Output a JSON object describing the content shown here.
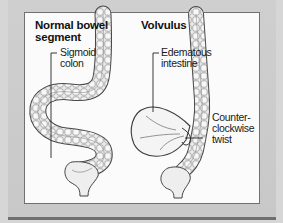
{
  "figure": {
    "panels": [
      {
        "title_line1": "Normal bowel",
        "title_line2": "segment",
        "labels": [
          {
            "line1": "Sigmoid",
            "line2": "colon"
          }
        ]
      },
      {
        "title_line1": "Volvulus",
        "labels": [
          {
            "line1": "Edematous",
            "line2": "intestine"
          },
          {
            "line1": "Counter-",
            "line2": "clockwise",
            "line3": "twist"
          }
        ]
      }
    ],
    "colors": {
      "background": "#d6d6d6",
      "panel": "#fbfbfb",
      "line": "#333333",
      "bowel_fill": "#e4e4e4"
    }
  }
}
